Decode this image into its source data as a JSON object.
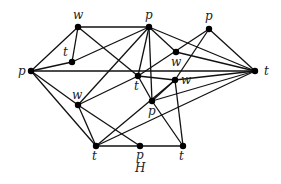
{
  "graph": {
    "caption": "H",
    "nodes": [
      {
        "id": "p_left",
        "label": "p"
      },
      {
        "id": "w_top",
        "label": "w"
      },
      {
        "id": "t_small",
        "label": "t"
      },
      {
        "id": "p_top",
        "label": "p"
      },
      {
        "id": "p_topright",
        "label": "p"
      },
      {
        "id": "w_mid",
        "label": "w"
      },
      {
        "id": "t_right",
        "label": "t"
      },
      {
        "id": "t_center",
        "label": "t"
      },
      {
        "id": "w_center",
        "label": "w"
      },
      {
        "id": "p_center",
        "label": "p"
      },
      {
        "id": "w_left",
        "label": "w"
      },
      {
        "id": "t_bottom",
        "label": "t"
      },
      {
        "id": "p_bottom",
        "label": "p"
      },
      {
        "id": "t_bottomright",
        "label": "t"
      }
    ],
    "edges": [
      [
        "p_left",
        "w_top"
      ],
      [
        "p_left",
        "t_small"
      ],
      [
        "p_left",
        "t_right"
      ],
      [
        "p_left",
        "w_left"
      ],
      [
        "p_left",
        "t_bottom"
      ],
      [
        "w_top",
        "t_small"
      ],
      [
        "w_top",
        "p_top"
      ],
      [
        "w_top",
        "t_center"
      ],
      [
        "t_small",
        "p_top"
      ],
      [
        "p_top",
        "w_mid"
      ],
      [
        "p_top",
        "t_center"
      ],
      [
        "p_top",
        "t_right"
      ],
      [
        "p_top",
        "w_left"
      ],
      [
        "p_top",
        "p_center"
      ],
      [
        "p_topright",
        "w_center"
      ],
      [
        "p_topright",
        "t_center"
      ],
      [
        "p_topright",
        "t_right"
      ],
      [
        "w_mid",
        "t_right"
      ],
      [
        "t_center",
        "w_center"
      ],
      [
        "w_center",
        "t_right"
      ],
      [
        "t_center",
        "p_center"
      ],
      [
        "w_center",
        "t_bottomright"
      ],
      [
        "w_center",
        "p_center"
      ],
      [
        "p_center",
        "t_right"
      ],
      [
        "p_center",
        "t_bottomright"
      ],
      [
        "w_left",
        "t_center"
      ],
      [
        "w_left",
        "t_bottom"
      ],
      [
        "w_left",
        "p_bottom"
      ],
      [
        "t_bottom",
        "p_bottom"
      ],
      [
        "p_bottom",
        "t_bottomright"
      ],
      [
        "t_bottom",
        "t_right"
      ],
      [
        "t_bottom",
        "w_center"
      ]
    ]
  }
}
